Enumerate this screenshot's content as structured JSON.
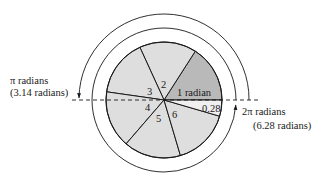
{
  "diagram": {
    "center": {
      "x": 164,
      "y": 100
    },
    "circle_radius": 58,
    "inner_arrow_radius": 72,
    "outer_arrow_radius": 85,
    "colors": {
      "one_radian_wedge": "#b9b9b9",
      "other_wedges": "#dedede",
      "remainder_wedge": "#f0f0f0",
      "stroke": "#1a1a1a"
    },
    "wedges": [
      {
        "label": "1 radian",
        "from_rad": 0,
        "to_rad": 1
      },
      {
        "label": "2",
        "from_rad": 1,
        "to_rad": 2
      },
      {
        "label": "3",
        "from_rad": 2,
        "to_rad": 3
      },
      {
        "label": "4",
        "from_rad": 3,
        "to_rad": 4
      },
      {
        "label": "5",
        "from_rad": 4,
        "to_rad": 5
      },
      {
        "label": "6",
        "from_rad": 5,
        "to_rad": 6
      },
      {
        "label": "0.28",
        "from_rad": 6,
        "to_rad": 6.2832
      }
    ],
    "pi_label": {
      "line1": "π radians",
      "line2": "(3.14 radians)"
    },
    "two_pi_label": {
      "line1": "2π radians",
      "line2": "(6.28 radians)"
    }
  }
}
